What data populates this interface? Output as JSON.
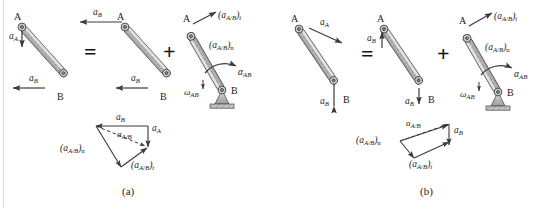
{
  "figure": {
    "captions": [
      {
        "id": "caption-a",
        "text": "(a)"
      },
      {
        "id": "caption-b",
        "text": "(b)"
      }
    ],
    "operators": [
      {
        "id": "equals-a",
        "symbol": "="
      },
      {
        "id": "plus-a",
        "symbol": "+"
      },
      {
        "id": "equals-b",
        "symbol": "="
      },
      {
        "id": "plus-b",
        "symbol": "+"
      }
    ],
    "points": {
      "a": "A",
      "b": "B"
    },
    "panel_a": {
      "name": "panel-a",
      "bar1": {
        "name": "bar-ab-total-a",
        "point_a": "A",
        "point_b": "B",
        "vectors": [
          {
            "name": "accel-a-vector",
            "label": "a",
            "sub": "A",
            "direction": "down"
          },
          {
            "name": "accel-b-vector",
            "label": "a",
            "sub": "B",
            "direction": "left"
          }
        ]
      },
      "bar2": {
        "name": "bar-ab-translation-a",
        "point_a": "A",
        "point_b": "B",
        "vectors": [
          {
            "name": "accel-b-top-vector",
            "label": "a",
            "sub": "B",
            "direction": "left"
          },
          {
            "name": "accel-b-bottom-vector",
            "label": "a",
            "sub": "B",
            "direction": "left"
          }
        ]
      },
      "bar3": {
        "name": "bar-ab-rotation-a",
        "point_a": "A",
        "point_b": "B",
        "vectors": [
          {
            "name": "accel-rel-tangential-label",
            "label": "(a",
            "sub": "A/B",
            "close": ")",
            "post": "t"
          },
          {
            "name": "accel-rel-normal-label",
            "label": "(a",
            "sub": "A/B",
            "close": ")",
            "post": "n"
          },
          {
            "name": "alpha-ab-label",
            "label": "α",
            "sub": "AB"
          },
          {
            "name": "omega-ab-label",
            "label": "ω",
            "sub": "AB"
          }
        ],
        "support": "pin-support"
      },
      "polygon": {
        "name": "vector-polygon-a",
        "vectors": [
          {
            "name": "poly-a-ab",
            "label": "a",
            "sub": "B"
          },
          {
            "name": "poly-a-aa",
            "label": "a",
            "sub": "A"
          },
          {
            "name": "poly-a-rel",
            "label": "a",
            "sub": "A/B",
            "style": "dashed"
          },
          {
            "name": "poly-a-normal",
            "label": "(a",
            "sub": "A/B",
            "close": ")",
            "post": "n"
          },
          {
            "name": "poly-a-tangential",
            "label": "(a",
            "sub": "A/B",
            "close": ")",
            "post": "t"
          }
        ]
      }
    },
    "panel_b": {
      "name": "panel-b",
      "bar1": {
        "name": "bar-ab-total-b",
        "point_a": "A",
        "point_b": "B",
        "vectors": [
          {
            "name": "accel-a-vector",
            "label": "a",
            "sub": "A",
            "direction": "right-down"
          },
          {
            "name": "accel-b-vector",
            "label": "a",
            "sub": "B",
            "direction": "down"
          }
        ]
      },
      "bar2": {
        "name": "bar-ab-translation-b",
        "point_a": "A",
        "point_b": "B",
        "vectors": [
          {
            "name": "accel-b-top-vector",
            "label": "a",
            "sub": "B",
            "direction": "up"
          },
          {
            "name": "accel-b-bottom-vector",
            "label": "a",
            "sub": "B",
            "direction": "down"
          }
        ]
      },
      "bar3": {
        "name": "bar-ab-rotation-b",
        "point_a": "A",
        "point_b": "B",
        "vectors": [
          {
            "name": "accel-rel-tangential-label",
            "label": "(a",
            "sub": "A/B",
            "close": ")",
            "post": "t"
          },
          {
            "name": "accel-rel-normal-label",
            "label": "(a",
            "sub": "A/B",
            "close": ")",
            "post": "n"
          },
          {
            "name": "alpha-ab-label",
            "label": "α",
            "sub": "AB"
          },
          {
            "name": "omega-ab-label",
            "label": "ω",
            "sub": "AB"
          }
        ],
        "support": "pin-support"
      },
      "polygon": {
        "name": "vector-polygon-b",
        "vectors": [
          {
            "name": "poly-b-rel",
            "label": "a",
            "sub": "A/B",
            "style": "dashed"
          },
          {
            "name": "poly-b-ab",
            "label": "a",
            "sub": "B"
          },
          {
            "name": "poly-b-normal",
            "label": "(a",
            "sub": "A/B",
            "close": ")",
            "post": "n"
          },
          {
            "name": "poly-b-tangential",
            "label": "(a",
            "sub": "A/B",
            "close": ")",
            "post": "t"
          }
        ]
      }
    },
    "colors": {
      "bar_fill": "#c9c9c9",
      "bar_edge": "#4a4a4a",
      "arrow": "#3a3a3a",
      "support_fill": "#b5b5b5",
      "text": "#1c1c1c"
    }
  }
}
